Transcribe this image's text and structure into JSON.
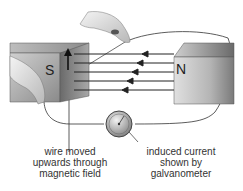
{
  "diagram": {
    "magnets": {
      "south_label": "S",
      "north_label": "N"
    },
    "field_lines": {
      "count": 5,
      "direction": "N to S"
    },
    "wire_arrow": "up",
    "labels": {
      "wire": [
        "wire moved",
        "upwards through",
        "magnetic field"
      ],
      "galvanometer": [
        "induced current",
        "shown by",
        "galvanometer"
      ]
    },
    "colors": {
      "line": "#333333",
      "magnet_dark": "#6e6e6e",
      "magnet_light": "#d6d6d6"
    }
  }
}
